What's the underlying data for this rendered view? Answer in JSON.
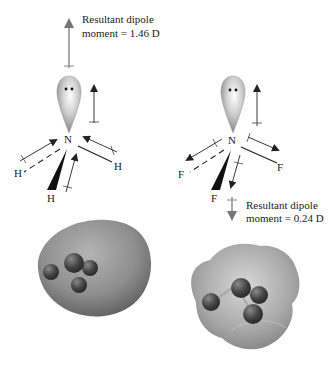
{
  "figure": {
    "left_molecule": {
      "name": "NH3",
      "central_atom": "N",
      "substituents": [
        "H",
        "H",
        "H"
      ],
      "resultant_label_line1": "Resultant dipole",
      "resultant_label_line2": "moment = 1.46 D",
      "resultant_direction": "up"
    },
    "right_molecule": {
      "name": "NF3",
      "central_atom": "N",
      "substituents": [
        "F",
        "F",
        "F"
      ],
      "resultant_label_line1": "Resultant dipole",
      "resultant_label_line2": "moment = 0.24 D",
      "resultant_direction": "down"
    },
    "lone_pair_glyph": "••",
    "colors": {
      "line": "#222222",
      "arrow_gray": "#888888",
      "lobe_light": "#f4f4f4",
      "lobe_dark": "#8a8a8a",
      "surface": "#9a9a9a",
      "atom_ball": "#4a4a4a"
    }
  }
}
